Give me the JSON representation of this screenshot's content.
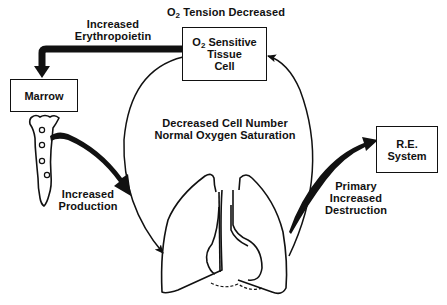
{
  "diagram": {
    "title_prefix": "O",
    "title_sub": "2",
    "title_rest": " Tension Decreased",
    "sensor_box": {
      "line1_prefix": "O",
      "line1_sub": "2",
      "line1_rest": " Sensitive",
      "line2": "Tissue",
      "line3": "Cell"
    },
    "epo_label": {
      "line1": "Increased",
      "line2": "Erythropoietin"
    },
    "marrow_box": {
      "label": "Marrow"
    },
    "production_label": {
      "line1": "Increased",
      "line2": "Production"
    },
    "center_label": {
      "line1": "Decreased Cell Number",
      "line2": "Normal Oxygen Saturation"
    },
    "re_box": {
      "line1": "R.E.",
      "line2": "System"
    },
    "destruction_label": {
      "line1": "Primary",
      "line2": "Increased",
      "line3": "Destruction"
    },
    "colors": {
      "ink": "#111111",
      "background": "#ffffff"
    }
  }
}
